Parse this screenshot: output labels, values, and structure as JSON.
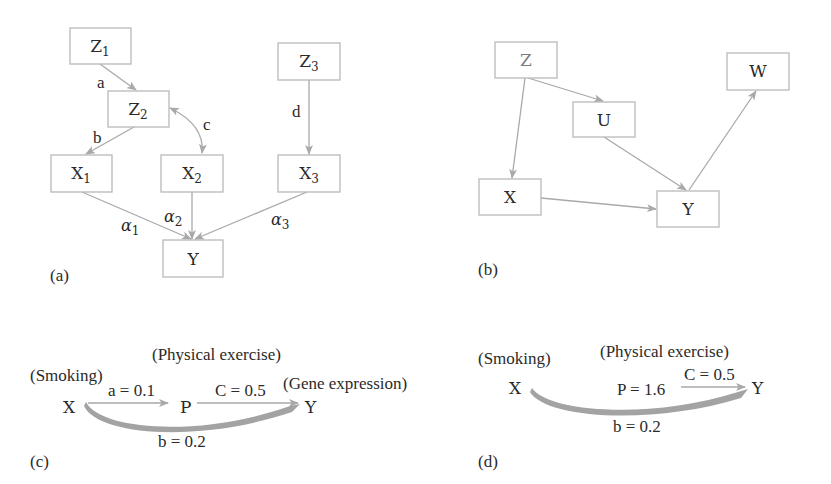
{
  "figure": {
    "colors": {
      "box_border": "#b9b9b9",
      "arrow": "#a9a9a9",
      "text": "#2a2a2a",
      "faded_text": "#7a7a7a"
    },
    "panels": {
      "a": {
        "label": "(a)",
        "nodes": {
          "z1": {
            "main": "Z",
            "sub": "1"
          },
          "z2": {
            "main": "Z",
            "sub": "2"
          },
          "z3": {
            "main": "Z",
            "sub": "3"
          },
          "x1": {
            "main": "X",
            "sub": "1"
          },
          "x2": {
            "main": "X",
            "sub": "2"
          },
          "x3": {
            "main": "X",
            "sub": "3"
          },
          "y": {
            "main": "Y"
          }
        },
        "edges": {
          "z1_z2": "a",
          "z2_x1": "b",
          "z2_x2": "c",
          "z3_x3": "d",
          "x1_y": {
            "main": "α",
            "sub": "1"
          },
          "x2_y": {
            "main": "α",
            "sub": "2"
          },
          "x3_y": {
            "main": "α",
            "sub": "3"
          }
        }
      },
      "b": {
        "label": "(b)",
        "nodes": {
          "z": "Z",
          "u": "U",
          "w": "W",
          "x": "X",
          "y": "Y"
        }
      },
      "c": {
        "label": "(c)",
        "annotations": {
          "smoking": "(Smoking)",
          "physical_exercise": "(Physical exercise)",
          "gene_expression": "(Gene expression)"
        },
        "nodes": {
          "x": "X",
          "p": "P",
          "y": "Y"
        },
        "edges": {
          "x_p": "a = 0.1",
          "p_y": "C = 0.5",
          "x_y": "b = 0.2"
        }
      },
      "d": {
        "label": "(d)",
        "annotations": {
          "smoking": "(Smoking)",
          "physical_exercise": "(Physical exercise)"
        },
        "nodes": {
          "x": "X",
          "p": "P = 1.6",
          "y": "Y"
        },
        "edges": {
          "p_y": "C = 0.5",
          "x_y": "b = 0.2"
        }
      }
    }
  }
}
